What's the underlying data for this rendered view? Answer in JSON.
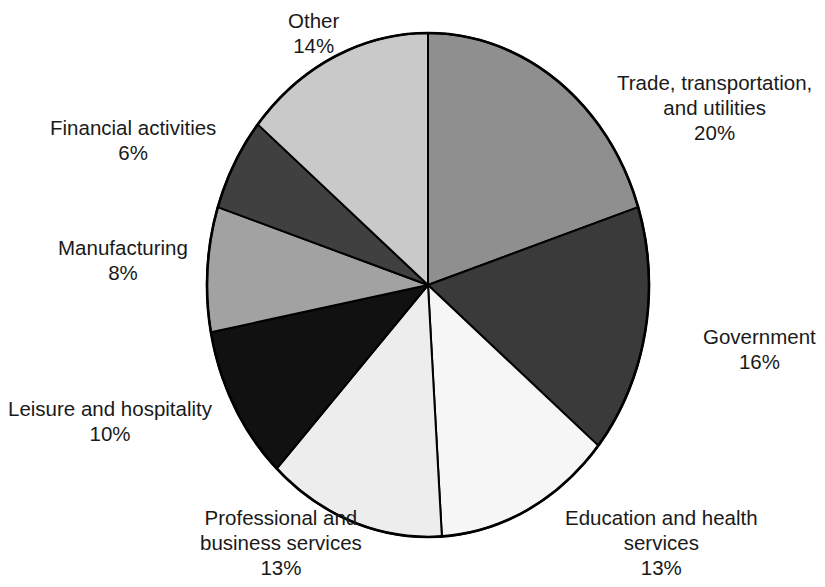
{
  "chart_data": {
    "type": "pie",
    "title": "",
    "subtitle": "",
    "xlabel": "",
    "ylabel": "",
    "legend_position": "none",
    "grid": false,
    "start_angle_deg": 0,
    "direction": "clockwise",
    "units": "percent",
    "categories": [
      "Trade, transportation, and utilities",
      "Government",
      "Education and health services",
      "Professional and business services",
      "Leisure and hospitality",
      "Manufacturing",
      "Financial activities",
      "Other"
    ],
    "values": [
      20,
      16,
      13,
      13,
      10,
      8,
      6,
      14
    ],
    "colors": [
      "#8f8f8f",
      "#3a3a3a",
      "#f6f6f6",
      "#ededed",
      "#111111",
      "#a2a2a2",
      "#404040",
      "#c9c9c9"
    ],
    "slice_outline_color": "#000000",
    "slices": [
      {
        "name": "Trade, transportation, and utilities",
        "value": 20,
        "percent_label": "20%",
        "color": "#8f8f8f",
        "label_lines": [
          "Trade, transportation,",
          "and utilities"
        ]
      },
      {
        "name": "Government",
        "value": 16,
        "percent_label": "16%",
        "color": "#3a3a3a",
        "label_lines": [
          "Government"
        ]
      },
      {
        "name": "Education and health services",
        "value": 13,
        "percent_label": "13%",
        "color": "#f6f6f6",
        "label_lines": [
          "Education and health",
          "services"
        ]
      },
      {
        "name": "Professional and business services",
        "value": 13,
        "percent_label": "13%",
        "color": "#ededed",
        "label_lines": [
          "Professional and",
          "business services"
        ]
      },
      {
        "name": "Leisure and hospitality",
        "value": 10,
        "percent_label": "10%",
        "color": "#111111",
        "label_lines": [
          "Leisure and hospitality"
        ]
      },
      {
        "name": "Manufacturing",
        "value": 8,
        "percent_label": "8%",
        "color": "#a2a2a2",
        "label_lines": [
          "Manufacturing"
        ]
      },
      {
        "name": "Financial activities",
        "value": 6,
        "percent_label": "6%",
        "color": "#404040",
        "label_lines": [
          "Financial activities"
        ]
      },
      {
        "name": "Other",
        "value": 14,
        "percent_label": "14%",
        "color": "#c9c9c9",
        "label_lines": [
          "Other"
        ]
      }
    ]
  },
  "labels": {
    "trade": {
      "line1": "Trade, transportation,",
      "line2": "and utilities",
      "pct": "20%"
    },
    "government": {
      "line1": "Government",
      "pct": "16%"
    },
    "education": {
      "line1": "Education and health",
      "line2": "services",
      "pct": "13%"
    },
    "professional": {
      "line1": "Professional and",
      "line2": "business services",
      "pct": "13%"
    },
    "leisure": {
      "line1": "Leisure and hospitality",
      "pct": "10%"
    },
    "manufacturing": {
      "line1": "Manufacturing",
      "pct": "8%"
    },
    "financial": {
      "line1": "Financial activities",
      "pct": "6%"
    },
    "other": {
      "line1": "Other",
      "pct": "14%"
    }
  }
}
